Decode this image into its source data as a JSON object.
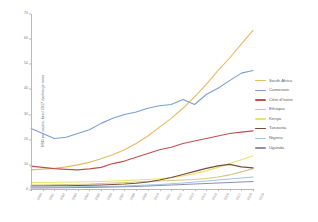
{
  "chart_data": {
    "type": "line",
    "title": "",
    "xlabel": "",
    "ylabel": "USD per capita, fixed 2017 exchange rates",
    "ylim": [
      0,
      70
    ],
    "yticks": [
      0,
      10,
      20,
      30,
      40,
      50,
      60,
      70
    ],
    "ytick_labels": [
      "0",
      "10",
      "20",
      "30",
      "40",
      "50",
      "60",
      "70"
    ],
    "grid": false,
    "legend_position": "right",
    "categories": [
      "2000",
      "2001",
      "2002",
      "2003",
      "2004",
      "2005",
      "2006",
      "2007",
      "2008",
      "2009",
      "2010",
      "2011",
      "2012",
      "2013",
      "2014",
      "2015",
      "2016",
      "2017",
      "2018",
      "2019"
    ],
    "series": [
      {
        "name": "South Africa",
        "color": "#e8b964",
        "values": [
          8.0,
          8.3,
          8.6,
          9.2,
          10.0,
          11.0,
          12.4,
          14.0,
          16.0,
          18.5,
          21.5,
          25.0,
          28.5,
          32.5,
          37.0,
          42.0,
          47.5,
          52.5,
          58.0,
          63.5
        ]
      },
      {
        "name": "Cameroon",
        "color": "#7b9fd4",
        "values": [
          24.5,
          22.5,
          20.5,
          21.0,
          22.5,
          24.0,
          26.5,
          28.5,
          30.0,
          31.0,
          32.5,
          33.5,
          34.0,
          36.0,
          34.0,
          38.0,
          40.5,
          43.5,
          46.5,
          47.5
        ]
      },
      {
        "name": "Côte d'Ivoire",
        "color": "#c0504d",
        "values": [
          9.5,
          9.0,
          8.5,
          8.2,
          8.0,
          8.4,
          9.0,
          10.5,
          11.5,
          13.0,
          14.5,
          16.0,
          17.0,
          18.5,
          19.5,
          20.5,
          21.5,
          22.5,
          23.0,
          23.5
        ]
      },
      {
        "name": "Ethiopia",
        "color": "#d6c48a",
        "values": [
          2.0,
          2.0,
          2.1,
          2.2,
          2.3,
          2.4,
          2.6,
          2.8,
          3.0,
          3.2,
          3.4,
          3.6,
          3.8,
          4.0,
          4.2,
          4.6,
          5.2,
          6.0,
          7.2,
          8.5
        ]
      },
      {
        "name": "Kenya",
        "color": "#e8e36a",
        "values": [
          3.0,
          3.0,
          3.1,
          3.1,
          3.2,
          3.3,
          3.4,
          3.6,
          3.8,
          4.0,
          4.2,
          4.5,
          5.0,
          5.6,
          6.5,
          7.6,
          9.0,
          10.5,
          12.0,
          13.5
        ]
      },
      {
        "name": "Tanzania",
        "color": "#7b4b3a",
        "values": [
          1.6,
          1.6,
          1.7,
          1.7,
          1.8,
          1.9,
          2.0,
          2.2,
          2.4,
          2.7,
          3.2,
          4.0,
          5.0,
          6.2,
          7.4,
          8.6,
          9.6,
          10.2,
          9.2,
          8.8
        ]
      },
      {
        "name": "Nigeria",
        "color": "#9ec8e0",
        "values": [
          1.2,
          1.2,
          1.2,
          1.3,
          1.3,
          1.4,
          1.4,
          1.5,
          1.6,
          1.8,
          2.0,
          2.2,
          2.5,
          2.8,
          3.2,
          3.6,
          4.0,
          4.4,
          4.8,
          5.2
        ]
      },
      {
        "name": "Uganda",
        "color": "#8f8fb0",
        "values": [
          0.8,
          0.8,
          0.9,
          0.9,
          1.0,
          1.0,
          1.1,
          1.2,
          1.3,
          1.4,
          1.6,
          1.8,
          2.0,
          2.2,
          2.4,
          2.6,
          2.8,
          3.0,
          3.2,
          3.4
        ]
      }
    ]
  }
}
